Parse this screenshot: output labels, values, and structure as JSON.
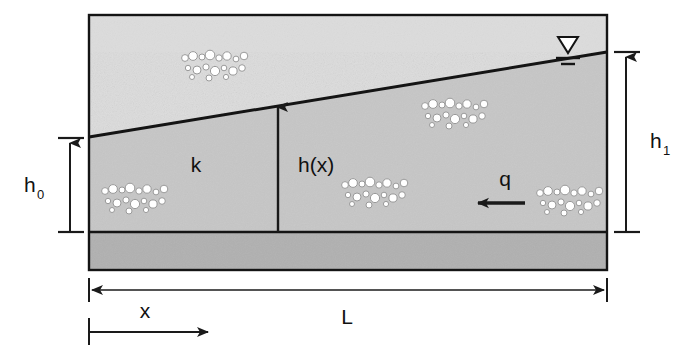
{
  "figure": {
    "type": "technical-diagram"
  },
  "labels": {
    "h0_base": "h",
    "h0_sub": "0",
    "h1_base": "h",
    "h1_sub": "1",
    "hx": "h(x)",
    "k": "k",
    "q": "q",
    "L": "L",
    "x": "x"
  },
  "icons": {
    "water_table": "water-table-symbol",
    "flow_arrow": "leftward-flow-arrow",
    "head_arrow": "upward-head-arrow"
  },
  "colors": {
    "unsaturated_zone": "#dcdcdc",
    "saturated_zone": "#c6c6c6",
    "bedrock_layer": "#b0b0b0",
    "outline": "#141414",
    "line": "#1a1a1a",
    "text": "#111111",
    "background": "#ffffff",
    "grain_fill": "#ffffff",
    "grain_stroke": "#9a9a9a"
  },
  "geometry": {
    "box": {
      "x": 89,
      "y": 15,
      "width": 518,
      "height": 255
    },
    "aquifer_base_y": 232,
    "water_table_left_y": 137,
    "water_table_right_y": 52,
    "hx_station_x": 278,
    "h0_dimension": {
      "x": 70,
      "top": 138,
      "bottom": 232
    },
    "h1_dimension": {
      "x": 626,
      "top": 52,
      "bottom": 232
    },
    "L_dimension": {
      "y": 290,
      "left": 89,
      "right": 607
    },
    "x_dimension": {
      "y": 330,
      "left": 89,
      "right": 213
    }
  },
  "annotations": [
    {
      "name": "hydraulic-conductivity",
      "text": "k",
      "meaning": "hydraulic conductivity of aquifer"
    },
    {
      "name": "specific-discharge",
      "text": "q",
      "meaning": "flux, directed to the left"
    },
    {
      "name": "head-at-x",
      "text": "h(x)",
      "meaning": "saturated thickness at distance x"
    },
    {
      "name": "head-upstream",
      "text": "h1",
      "meaning": "head at right boundary"
    },
    {
      "name": "head-downstream",
      "text": "h0",
      "meaning": "head at left boundary"
    },
    {
      "name": "aquifer-length",
      "text": "L",
      "meaning": "total horizontal length"
    },
    {
      "name": "distance-coordinate",
      "text": "x",
      "meaning": "horizontal coordinate from left boundary"
    }
  ],
  "grain_clusters": [
    {
      "name": "grain-cluster-upper-left",
      "cx": 215,
      "cy": 65
    },
    {
      "name": "grain-cluster-mid-right",
      "cx": 455,
      "cy": 113
    },
    {
      "name": "grain-cluster-lower-left",
      "cx": 135,
      "cy": 198
    },
    {
      "name": "grain-cluster-lower-mid",
      "cx": 375,
      "cy": 192
    },
    {
      "name": "grain-cluster-lower-right",
      "cx": 570,
      "cy": 200
    }
  ]
}
